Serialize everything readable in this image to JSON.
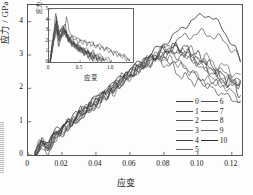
{
  "chart_data": {
    "type": "line",
    "title": "",
    "xlabel": "应变",
    "ylabel": "应力 / GPa",
    "xlim": [
      0,
      0.126
    ],
    "ylim": [
      0,
      4.5
    ],
    "xticks": [
      "0",
      "0.02",
      "0.04",
      "0.06",
      "0.08",
      "0.10",
      "0.12"
    ],
    "xtick_values": [
      0,
      0.02,
      0.04,
      0.06,
      0.08,
      0.1,
      0.12
    ],
    "yticks": [
      "0",
      "1",
      "2",
      "3",
      "4"
    ],
    "ytick_values": [
      0,
      1,
      2,
      3,
      4
    ],
    "grid": false,
    "legend_position": "lower-right",
    "series": [
      {
        "name": "0",
        "color": "#3a3a3a",
        "x": [
          0.004,
          0.008,
          0.012,
          0.016,
          0.02,
          0.026,
          0.032,
          0.038,
          0.044,
          0.05,
          0.056,
          0.062,
          0.068,
          0.074,
          0.08,
          0.086,
          0.092,
          0.096,
          0.1,
          0.104,
          0.107,
          0.11,
          0.114,
          0.118,
          0.122,
          0.125
        ],
        "y": [
          0.02,
          0.52,
          0.34,
          0.72,
          0.88,
          1.1,
          1.4,
          1.62,
          1.92,
          2.12,
          2.42,
          2.62,
          2.86,
          3.1,
          3.34,
          3.58,
          3.86,
          4.02,
          4.12,
          4.22,
          4.18,
          4.06,
          3.82,
          3.52,
          3.2,
          2.8
        ]
      },
      {
        "name": "1",
        "color": "#4a4a4a",
        "x": [
          0.004,
          0.008,
          0.012,
          0.016,
          0.02,
          0.026,
          0.032,
          0.038,
          0.044,
          0.05,
          0.056,
          0.062,
          0.068,
          0.074,
          0.08,
          0.086,
          0.092,
          0.097,
          0.102,
          0.107,
          0.112,
          0.118,
          0.122,
          0.125
        ],
        "y": [
          0.01,
          0.38,
          0.26,
          0.62,
          0.8,
          1.02,
          1.3,
          1.52,
          1.8,
          2.02,
          2.3,
          2.52,
          2.76,
          2.96,
          3.18,
          3.38,
          3.54,
          3.62,
          3.66,
          3.62,
          3.52,
          3.3,
          3.1,
          2.82
        ]
      },
      {
        "name": "2",
        "color": "#555555",
        "x": [
          0.004,
          0.008,
          0.012,
          0.016,
          0.02,
          0.026,
          0.032,
          0.038,
          0.044,
          0.05,
          0.056,
          0.062,
          0.068,
          0.074,
          0.08,
          0.085,
          0.09,
          0.095,
          0.1,
          0.105,
          0.11,
          0.116,
          0.121,
          0.125
        ],
        "y": [
          0.01,
          0.3,
          0.22,
          0.56,
          0.74,
          0.96,
          1.24,
          1.46,
          1.74,
          1.96,
          2.24,
          2.46,
          2.7,
          2.88,
          3.0,
          3.04,
          3.0,
          2.92,
          2.82,
          2.7,
          2.58,
          2.42,
          2.3,
          2.22
        ]
      },
      {
        "name": "3",
        "color": "#606060",
        "x": [
          0.004,
          0.008,
          0.012,
          0.016,
          0.02,
          0.026,
          0.032,
          0.038,
          0.044,
          0.05,
          0.056,
          0.062,
          0.068,
          0.074,
          0.08,
          0.086,
          0.091,
          0.096,
          0.101,
          0.106,
          0.112,
          0.118,
          0.125
        ],
        "y": [
          0.01,
          0.26,
          0.18,
          0.5,
          0.7,
          0.92,
          1.2,
          1.42,
          1.7,
          1.92,
          2.2,
          2.44,
          2.68,
          2.9,
          3.08,
          3.18,
          3.16,
          3.08,
          2.96,
          2.86,
          2.7,
          2.56,
          2.42
        ]
      },
      {
        "name": "4",
        "color": "#3f3f3f",
        "x": [
          0.004,
          0.008,
          0.012,
          0.016,
          0.02,
          0.026,
          0.032,
          0.038,
          0.044,
          0.05,
          0.056,
          0.062,
          0.068,
          0.074,
          0.08,
          0.085,
          0.09,
          0.094,
          0.098,
          0.103,
          0.108,
          0.114,
          0.12,
          0.125
        ],
        "y": [
          0.01,
          0.44,
          0.3,
          0.66,
          0.84,
          1.06,
          1.34,
          1.56,
          1.84,
          2.06,
          2.34,
          2.56,
          2.8,
          2.96,
          2.88,
          2.8,
          2.74,
          2.6,
          2.4,
          2.18,
          2.0,
          1.84,
          1.7,
          1.58
        ]
      },
      {
        "name": "5",
        "color": "#6a6a6a",
        "x": [
          0.004,
          0.008,
          0.012,
          0.016,
          0.02,
          0.026,
          0.032,
          0.038,
          0.044,
          0.05,
          0.056,
          0.062,
          0.068,
          0.074,
          0.08,
          0.086,
          0.092,
          0.097,
          0.102,
          0.108,
          0.114,
          0.12,
          0.125
        ],
        "y": [
          0.01,
          0.34,
          0.24,
          0.58,
          0.78,
          0.98,
          1.26,
          1.48,
          1.76,
          1.98,
          2.26,
          2.48,
          2.72,
          2.92,
          3.06,
          3.14,
          3.06,
          2.92,
          2.74,
          2.52,
          2.34,
          2.22,
          2.14
        ]
      },
      {
        "name": "6",
        "color": "#505050",
        "x": [
          0.004,
          0.008,
          0.012,
          0.016,
          0.02,
          0.026,
          0.032,
          0.038,
          0.044,
          0.05,
          0.056,
          0.062,
          0.068,
          0.074,
          0.08,
          0.085,
          0.089,
          0.093,
          0.098,
          0.104,
          0.11,
          0.117,
          0.125
        ],
        "y": [
          0.01,
          0.28,
          0.2,
          0.54,
          0.72,
          0.94,
          1.22,
          1.44,
          1.72,
          1.94,
          2.22,
          2.44,
          2.66,
          2.84,
          2.78,
          2.62,
          2.44,
          2.3,
          2.22,
          2.16,
          2.12,
          2.16,
          2.24
        ]
      },
      {
        "name": "7",
        "color": "#464646",
        "x": [
          0.004,
          0.008,
          0.012,
          0.016,
          0.02,
          0.026,
          0.032,
          0.038,
          0.044,
          0.05,
          0.056,
          0.062,
          0.068,
          0.074,
          0.08,
          0.086,
          0.092,
          0.098,
          0.104,
          0.11,
          0.116,
          0.121,
          0.125
        ],
        "y": [
          0.01,
          0.4,
          0.28,
          0.64,
          0.82,
          1.04,
          1.32,
          1.54,
          1.82,
          2.04,
          2.32,
          2.54,
          2.78,
          2.98,
          3.14,
          3.2,
          3.1,
          2.9,
          2.66,
          2.44,
          2.28,
          2.2,
          2.18
        ]
      },
      {
        "name": "8",
        "color": "#5a5a5a",
        "x": [
          0.004,
          0.008,
          0.012,
          0.016,
          0.02,
          0.026,
          0.032,
          0.038,
          0.044,
          0.05,
          0.056,
          0.062,
          0.068,
          0.074,
          0.08,
          0.086,
          0.092,
          0.097,
          0.103,
          0.109,
          0.115,
          0.121,
          0.125
        ],
        "y": [
          0.01,
          0.24,
          0.18,
          0.48,
          0.68,
          0.9,
          1.18,
          1.4,
          1.68,
          1.9,
          2.18,
          2.42,
          2.66,
          2.88,
          3.04,
          3.12,
          3.04,
          2.88,
          2.62,
          2.34,
          2.08,
          1.84,
          1.62
        ]
      },
      {
        "name": "9",
        "color": "#656565",
        "x": [
          0.004,
          0.008,
          0.012,
          0.016,
          0.02,
          0.026,
          0.032,
          0.038,
          0.044,
          0.05,
          0.056,
          0.062,
          0.068,
          0.074,
          0.08,
          0.085,
          0.09,
          0.095,
          0.101,
          0.107,
          0.113,
          0.119,
          0.125
        ],
        "y": [
          0.01,
          0.32,
          0.22,
          0.56,
          0.76,
          0.96,
          1.24,
          1.46,
          1.74,
          1.96,
          2.24,
          2.46,
          2.68,
          2.86,
          2.92,
          2.84,
          2.7,
          2.52,
          2.34,
          2.22,
          2.14,
          2.16,
          2.2
        ]
      },
      {
        "name": "10",
        "color": "#2e2e2e",
        "x": [
          0.004,
          0.008,
          0.012,
          0.016,
          0.02,
          0.026,
          0.032,
          0.038,
          0.044,
          0.05,
          0.056,
          0.062,
          0.068,
          0.074,
          0.08,
          0.086,
          0.092,
          0.098,
          0.104,
          0.11,
          0.116,
          0.121,
          0.125
        ],
        "y": [
          0.01,
          0.36,
          0.26,
          0.6,
          0.8,
          1.0,
          1.28,
          1.5,
          1.78,
          2.0,
          2.28,
          2.5,
          2.74,
          2.94,
          3.12,
          3.24,
          3.22,
          3.06,
          2.84,
          2.56,
          2.28,
          2.02,
          1.78
        ]
      }
    ]
  },
  "inset_chart_data": {
    "type": "line",
    "title": "",
    "xlabel": "应变",
    "ylabel": "应力 / GPa",
    "xlim": [
      0,
      1.35
    ],
    "ylim": [
      0,
      5
    ],
    "xticks": [
      "0",
      "0.5",
      "1.0"
    ],
    "xtick_values": [
      0,
      0.5,
      1.0
    ],
    "yticks": [
      "0",
      "1",
      "2",
      "3",
      "4",
      "5"
    ],
    "ytick_values": [
      0,
      1,
      2,
      3,
      4,
      5
    ],
    "grid": false,
    "series": [
      {
        "name": "inset-0",
        "color": "#3a3a3a",
        "x": [
          0.02,
          0.08,
          0.12,
          0.16,
          0.2,
          0.24,
          0.28,
          0.32,
          0.36,
          0.42,
          0.48,
          0.54,
          0.6,
          0.68,
          0.76,
          0.84,
          0.92,
          1.0,
          1.08,
          1.16,
          1.24,
          1.3
        ],
        "y": [
          0.1,
          2.6,
          4.3,
          2.4,
          3.2,
          2.6,
          4.2,
          3.0,
          2.6,
          2.2,
          2.3,
          1.9,
          2.0,
          1.8,
          1.6,
          1.5,
          1.3,
          1.1,
          0.9,
          0.7,
          0.5,
          0.2
        ]
      },
      {
        "name": "inset-1",
        "color": "#4a4a4a",
        "x": [
          0.02,
          0.08,
          0.12,
          0.16,
          0.2,
          0.26,
          0.3,
          0.34,
          0.4,
          0.46,
          0.52,
          0.58,
          0.64,
          0.7,
          0.76,
          0.82,
          0.88,
          0.94,
          1.0
        ],
        "y": [
          0.1,
          2.2,
          3.6,
          2.0,
          2.8,
          3.4,
          2.6,
          2.2,
          1.9,
          1.6,
          1.4,
          1.2,
          1.0,
          0.9,
          0.7,
          0.6,
          0.4,
          0.3,
          0.1
        ]
      },
      {
        "name": "inset-2",
        "color": "#555555",
        "x": [
          0.02,
          0.07,
          0.11,
          0.15,
          0.19,
          0.24,
          0.29,
          0.33,
          0.38,
          0.44,
          0.5,
          0.56,
          0.62,
          0.68,
          0.74,
          0.8,
          0.86
        ],
        "y": [
          0.1,
          1.9,
          3.2,
          1.8,
          2.5,
          3.0,
          2.4,
          1.9,
          1.7,
          1.4,
          1.2,
          1.0,
          0.8,
          0.6,
          0.5,
          0.3,
          0.1
        ]
      },
      {
        "name": "inset-3",
        "color": "#606060",
        "x": [
          0.02,
          0.08,
          0.13,
          0.17,
          0.22,
          0.27,
          0.31,
          0.36,
          0.42,
          0.48,
          0.54,
          0.6,
          0.66,
          0.72,
          0.78
        ],
        "y": [
          0.1,
          2.4,
          3.9,
          2.2,
          3.0,
          2.8,
          2.2,
          1.8,
          1.5,
          1.3,
          1.1,
          0.9,
          0.7,
          0.4,
          0.1
        ]
      },
      {
        "name": "inset-4",
        "color": "#3f3f3f",
        "x": [
          0.02,
          0.07,
          0.12,
          0.16,
          0.21,
          0.26,
          0.3,
          0.35,
          0.41,
          0.47,
          0.53,
          0.59,
          0.65,
          0.71
        ],
        "y": [
          0.1,
          2.0,
          3.4,
          1.9,
          2.6,
          3.2,
          2.5,
          2.0,
          1.6,
          1.3,
          1.0,
          0.8,
          0.5,
          0.1
        ]
      },
      {
        "name": "inset-5",
        "color": "#6a6a6a",
        "x": [
          0.02,
          0.08,
          0.13,
          0.18,
          0.23,
          0.28,
          0.33,
          0.39,
          0.45,
          0.51,
          0.57,
          0.63,
          0.69
        ],
        "y": [
          0.1,
          2.3,
          3.7,
          2.1,
          2.9,
          2.7,
          2.1,
          1.7,
          1.4,
          1.1,
          0.9,
          0.6,
          0.2
        ]
      },
      {
        "name": "inset-6",
        "color": "#505050",
        "x": [
          0.02,
          0.07,
          0.11,
          0.16,
          0.21,
          0.25,
          0.3,
          0.36,
          0.42,
          0.48,
          0.55,
          0.62,
          0.7,
          0.78,
          0.86,
          0.94
        ],
        "y": [
          0.1,
          2.1,
          3.5,
          2.0,
          2.7,
          2.9,
          2.3,
          1.9,
          1.6,
          1.4,
          1.2,
          1.0,
          0.8,
          0.6,
          0.4,
          0.1
        ]
      },
      {
        "name": "inset-7",
        "color": "#464646",
        "x": [
          0.02,
          0.08,
          0.12,
          0.17,
          0.22,
          0.27,
          0.32,
          0.38,
          0.44,
          0.5,
          0.58,
          0.66,
          0.74,
          0.82,
          0.9,
          0.98,
          1.06,
          1.14,
          1.22,
          1.3
        ],
        "y": [
          0.1,
          2.5,
          4.1,
          2.3,
          3.1,
          2.5,
          2.2,
          2.4,
          2.0,
          1.9,
          1.8,
          1.7,
          1.5,
          1.4,
          1.2,
          1.0,
          0.8,
          0.6,
          0.4,
          0.1
        ]
      },
      {
        "name": "inset-8",
        "color": "#5a5a5a",
        "x": [
          0.02,
          0.07,
          0.12,
          0.16,
          0.2,
          0.25,
          0.3,
          0.35,
          0.41,
          0.47,
          0.53,
          0.6,
          0.67,
          0.74
        ],
        "y": [
          0.1,
          1.8,
          3.0,
          1.7,
          2.4,
          2.8,
          2.2,
          1.8,
          1.5,
          1.2,
          1.0,
          0.8,
          0.5,
          0.1
        ]
      },
      {
        "name": "inset-9",
        "color": "#656565",
        "x": [
          0.02,
          0.08,
          0.13,
          0.18,
          0.23,
          0.28,
          0.34,
          0.4,
          0.46,
          0.52,
          0.58,
          0.64,
          0.7,
          0.76,
          0.82
        ],
        "y": [
          0.1,
          2.2,
          3.8,
          2.1,
          2.8,
          2.6,
          2.0,
          1.7,
          1.4,
          1.2,
          1.0,
          0.8,
          0.6,
          0.4,
          0.1
        ]
      },
      {
        "name": "inset-10",
        "color": "#2e2e2e",
        "x": [
          0.02,
          0.07,
          0.11,
          0.15,
          0.2,
          0.25,
          0.29,
          0.34,
          0.4,
          0.46,
          0.52,
          0.58,
          0.64,
          0.7,
          0.76,
          0.82,
          0.88
        ],
        "y": [
          0.1,
          2.7,
          4.5,
          2.5,
          3.3,
          3.1,
          2.4,
          2.0,
          1.7,
          1.4,
          1.2,
          1.0,
          0.8,
          0.6,
          0.4,
          0.3,
          0.1
        ]
      }
    ]
  },
  "legend": {
    "column_left": [
      {
        "label": "0",
        "color": "#3a3a3a"
      },
      {
        "label": "1",
        "color": "#4a4a4a"
      },
      {
        "label": "2",
        "color": "#555555"
      },
      {
        "label": "3",
        "color": "#606060"
      },
      {
        "label": "4",
        "color": "#3f3f3f"
      },
      {
        "label": "5",
        "color": "#6a6a6a"
      }
    ],
    "column_right": [
      {
        "label": "6",
        "color": "#505050"
      },
      {
        "label": "7",
        "color": "#464646"
      },
      {
        "label": "8",
        "color": "#5a5a5a"
      },
      {
        "label": "9",
        "color": "#656565"
      },
      {
        "label": "10",
        "color": "#2e2e2e"
      }
    ]
  }
}
